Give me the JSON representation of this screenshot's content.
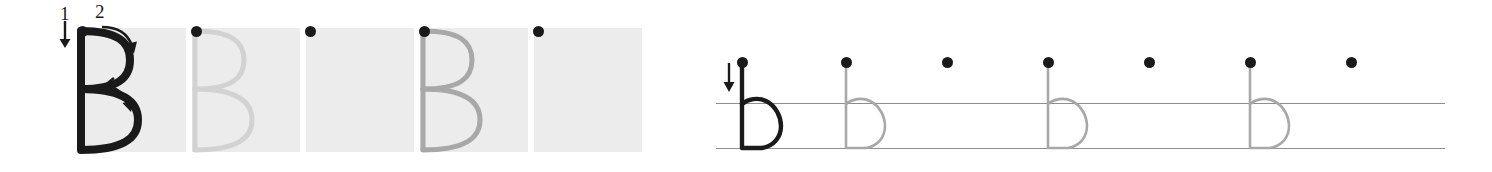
{
  "worksheet": {
    "title": "Letter B b handwriting practice",
    "letter_uppercase": "B",
    "letter_lowercase": "b",
    "background_color": "#ffffff",
    "box_fill_color": "#ececec",
    "model_stroke_color": "#1a1a1a",
    "trace_stroke_color_light": "#d2d2d2",
    "trace_stroke_color_medium": "#a8a8a8",
    "rule_line_color": "#8e8e8e",
    "start_dot_color": "#1a1a1a"
  },
  "uppercase_row": {
    "label": "Uppercase B practice boxes",
    "stroke_guides": [
      {
        "number": "1",
        "direction": "down",
        "arrow": "straight-down"
      },
      {
        "number": "2",
        "direction": "curve-right",
        "arrow": "curved-right"
      }
    ],
    "boxes": [
      {
        "index": 1,
        "kind": "model",
        "letter": "B",
        "stroke_color": "#1a1a1a",
        "has_start_dot": true,
        "has_stroke_numbers": true,
        "hint": "Solid black model letter with numbered stroke arrows"
      },
      {
        "index": 2,
        "kind": "trace",
        "letter": "B",
        "stroke_color": "#d2d2d2",
        "has_start_dot": true,
        "has_stroke_numbers": false,
        "hint": "Light gray letter to trace over"
      },
      {
        "index": 3,
        "kind": "blank",
        "letter": "",
        "stroke_color": "",
        "has_start_dot": true,
        "has_stroke_numbers": false,
        "hint": "Empty box with start dot"
      },
      {
        "index": 4,
        "kind": "trace",
        "letter": "B",
        "stroke_color": "#a8a8a8",
        "has_start_dot": true,
        "has_stroke_numbers": false,
        "hint": "Gray letter to trace over"
      },
      {
        "index": 5,
        "kind": "blank",
        "letter": "",
        "stroke_color": "",
        "has_start_dot": true,
        "has_stroke_numbers": false,
        "hint": "Empty box with start dot"
      }
    ]
  },
  "lowercase_row": {
    "label": "Lowercase b practice on ruled lines",
    "rules": [
      {
        "name": "midline",
        "y": 103
      },
      {
        "name": "baseline",
        "y": 148
      }
    ],
    "stroke_guides": [
      {
        "number": "",
        "direction": "down",
        "arrow": "straight-down"
      }
    ],
    "slots": [
      {
        "index": 1,
        "kind": "model",
        "letter": "b",
        "stroke_color": "#1a1a1a",
        "has_start_dot": true,
        "has_arrow": true,
        "hint": "Solid black model letter with down arrow"
      },
      {
        "index": 2,
        "kind": "trace",
        "letter": "b",
        "stroke_color": "#a8a8a8",
        "has_start_dot": true,
        "has_arrow": false,
        "hint": "Gray letter to trace over"
      },
      {
        "index": 3,
        "kind": "blank",
        "letter": "",
        "stroke_color": "",
        "has_start_dot": true,
        "has_arrow": false,
        "hint": "Start dot only"
      },
      {
        "index": 4,
        "kind": "trace",
        "letter": "b",
        "stroke_color": "#a8a8a8",
        "has_start_dot": true,
        "has_arrow": false,
        "hint": "Gray letter to trace over"
      },
      {
        "index": 5,
        "kind": "blank",
        "letter": "",
        "stroke_color": "",
        "has_start_dot": true,
        "has_arrow": false,
        "hint": "Start dot only"
      },
      {
        "index": 6,
        "kind": "trace",
        "letter": "b",
        "stroke_color": "#a8a8a8",
        "has_start_dot": true,
        "has_arrow": false,
        "hint": "Gray letter to trace over"
      },
      {
        "index": 7,
        "kind": "blank",
        "letter": "",
        "stroke_color": "",
        "has_start_dot": true,
        "has_arrow": false,
        "hint": "Start dot only"
      }
    ]
  }
}
